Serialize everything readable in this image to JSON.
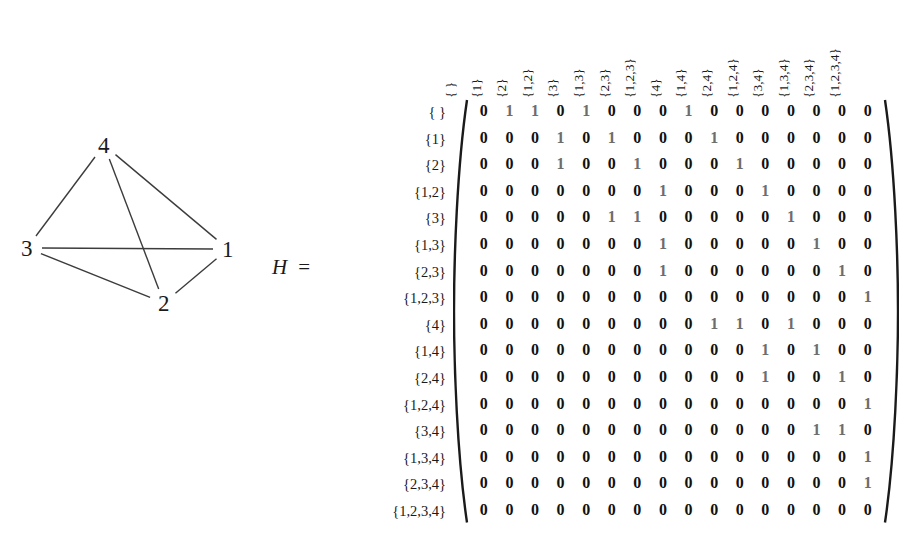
{
  "figure": {
    "matrix_name": "H",
    "equals_sign": "="
  },
  "graph": {
    "name": "graph-h",
    "vertices": [
      {
        "id": "4",
        "label": "4",
        "x": 104,
        "y": 35
      },
      {
        "id": "3",
        "label": "3",
        "x": 27,
        "y": 138
      },
      {
        "id": "1",
        "label": "1",
        "x": 228,
        "y": 139
      },
      {
        "id": "2",
        "label": "2",
        "x": 164,
        "y": 193
      }
    ],
    "edges": [
      {
        "from": "4",
        "to": "3"
      },
      {
        "from": "4",
        "to": "2"
      },
      {
        "from": "4",
        "to": "1"
      },
      {
        "from": "3",
        "to": "1"
      },
      {
        "from": "3",
        "to": "2"
      },
      {
        "from": "1",
        "to": "2"
      }
    ]
  },
  "matrix": {
    "col_headers": [
      "{ }",
      "{1}",
      "{2}",
      "{1,2}",
      "{3}",
      "{1,3}",
      "{2,3}",
      "{1,2,3}",
      "{4}",
      "{1,4}",
      "{2,4}",
      "{1,2,4}",
      "{3,4}",
      "{1,3,4}",
      "{2,3,4}",
      "{1,2,3,4}"
    ],
    "row_headers": [
      "{ }",
      "{1}",
      "{2}",
      "{1,2}",
      "{3}",
      "{1,3}",
      "{2,3}",
      "{1,2,3}",
      "{4}",
      "{1,4}",
      "{2,4}",
      "{1,2,4}",
      "{3,4}",
      "{1,3,4}",
      "{2,3,4}",
      "{1,2,3,4}"
    ],
    "rows": [
      [
        0,
        1,
        1,
        0,
        1,
        0,
        0,
        0,
        1,
        0,
        0,
        0,
        0,
        0,
        0,
        0
      ],
      [
        0,
        0,
        0,
        1,
        0,
        1,
        0,
        0,
        0,
        1,
        0,
        0,
        0,
        0,
        0,
        0
      ],
      [
        0,
        0,
        0,
        1,
        0,
        0,
        1,
        0,
        0,
        0,
        1,
        0,
        0,
        0,
        0,
        0
      ],
      [
        0,
        0,
        0,
        0,
        0,
        0,
        0,
        1,
        0,
        0,
        0,
        1,
        0,
        0,
        0,
        0
      ],
      [
        0,
        0,
        0,
        0,
        0,
        1,
        1,
        0,
        0,
        0,
        0,
        0,
        1,
        0,
        0,
        0
      ],
      [
        0,
        0,
        0,
        0,
        0,
        0,
        0,
        1,
        0,
        0,
        0,
        0,
        0,
        1,
        0,
        0
      ],
      [
        0,
        0,
        0,
        0,
        0,
        0,
        0,
        1,
        0,
        0,
        0,
        0,
        0,
        0,
        1,
        0
      ],
      [
        0,
        0,
        0,
        0,
        0,
        0,
        0,
        0,
        0,
        0,
        0,
        0,
        0,
        0,
        0,
        1
      ],
      [
        0,
        0,
        0,
        0,
        0,
        0,
        0,
        0,
        0,
        1,
        1,
        0,
        1,
        0,
        0,
        0
      ],
      [
        0,
        0,
        0,
        0,
        0,
        0,
        0,
        0,
        0,
        0,
        0,
        1,
        0,
        1,
        0,
        0
      ],
      [
        0,
        0,
        0,
        0,
        0,
        0,
        0,
        0,
        0,
        0,
        0,
        1,
        0,
        0,
        1,
        0
      ],
      [
        0,
        0,
        0,
        0,
        0,
        0,
        0,
        0,
        0,
        0,
        0,
        0,
        0,
        0,
        0,
        1
      ],
      [
        0,
        0,
        0,
        0,
        0,
        0,
        0,
        0,
        0,
        0,
        0,
        0,
        0,
        1,
        1,
        0
      ],
      [
        0,
        0,
        0,
        0,
        0,
        0,
        0,
        0,
        0,
        0,
        0,
        0,
        0,
        0,
        0,
        1
      ],
      [
        0,
        0,
        0,
        0,
        0,
        0,
        0,
        0,
        0,
        0,
        0,
        0,
        0,
        0,
        0,
        1
      ],
      [
        0,
        0,
        0,
        0,
        0,
        0,
        0,
        0,
        0,
        0,
        0,
        0,
        0,
        0,
        0,
        0
      ]
    ],
    "colors": {
      "zero": "#111111",
      "one": "#6d6d6d"
    }
  }
}
